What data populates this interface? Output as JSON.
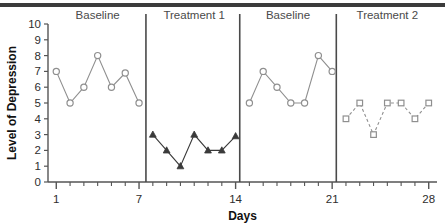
{
  "chart_data": {
    "type": "line",
    "title": "",
    "xlabel": "Days",
    "ylabel": "Level of Depression",
    "xlim": [
      0.4,
      28.6
    ],
    "ylim": [
      0,
      10
    ],
    "x_ticks_labeled": [
      1,
      7,
      14,
      21,
      28
    ],
    "y_ticks": [
      0,
      1,
      2,
      3,
      4,
      5,
      6,
      7,
      8,
      9,
      10
    ],
    "x_minor_tick_step": 1,
    "grid": false,
    "legend": "none",
    "phase_dividers": [
      7.5,
      14.3,
      21.3
    ],
    "phases": [
      {
        "label": "Baseline",
        "x_center": 4,
        "days": [
          1,
          2,
          3,
          4,
          5,
          6,
          7
        ]
      },
      {
        "label": "Treatment 1",
        "x_center": 11,
        "days": [
          8,
          9,
          10,
          11,
          12,
          13,
          14
        ]
      },
      {
        "label": "Baseline",
        "x_center": 17.8,
        "days": [
          15,
          16,
          17,
          18,
          19,
          20,
          21
        ]
      },
      {
        "label": "Treatment 2",
        "x_center": 25,
        "days": [
          22,
          23,
          24,
          25,
          26,
          27,
          28
        ]
      }
    ],
    "series": [
      {
        "name": "Baseline 1",
        "marker": "circle-open",
        "color": "#8f8f8f",
        "linestyle": "solid",
        "x": [
          1,
          2,
          3,
          4,
          5,
          6,
          7
        ],
        "values": [
          7,
          5,
          6,
          8,
          6,
          6.9,
          5
        ]
      },
      {
        "name": "Treatment 1",
        "marker": "triangle-filled",
        "color": "#3a3a3a",
        "linestyle": "solid",
        "x": [
          8,
          9,
          10,
          11,
          12,
          13,
          14
        ],
        "values": [
          3,
          2,
          1,
          3,
          2,
          2,
          2.9
        ]
      },
      {
        "name": "Baseline 2",
        "marker": "circle-open",
        "color": "#8f8f8f",
        "linestyle": "solid",
        "x": [
          15,
          16,
          17,
          18,
          19,
          20,
          21
        ],
        "values": [
          5,
          7,
          6,
          5,
          5,
          8,
          7
        ]
      },
      {
        "name": "Treatment 2",
        "marker": "square-open",
        "color": "#8f8f8f",
        "linestyle": "dashed",
        "x": [
          22,
          23,
          24,
          25,
          26,
          27,
          28
        ],
        "values": [
          4,
          5,
          3,
          5,
          5,
          4,
          5
        ]
      }
    ]
  }
}
